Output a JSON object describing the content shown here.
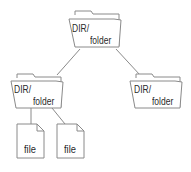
{
  "diagram": {
    "type": "directory-tree",
    "colors": {
      "stroke": "#8a8a8a",
      "fill": "#ffffff",
      "text": "#2a2a2a"
    },
    "nodes": [
      {
        "id": "root",
        "kind": "folder",
        "line1": "DIR/",
        "line2": "folder"
      },
      {
        "id": "left",
        "kind": "folder",
        "line1": "DIR/",
        "line2": "folder"
      },
      {
        "id": "right",
        "kind": "folder",
        "line1": "DIR/",
        "line2": "folder"
      },
      {
        "id": "file1",
        "kind": "file",
        "label": "file"
      },
      {
        "id": "file2",
        "kind": "file",
        "label": "file"
      }
    ],
    "edges": [
      {
        "from": "root",
        "to": "left"
      },
      {
        "from": "root",
        "to": "right"
      },
      {
        "from": "left",
        "to": "file1"
      },
      {
        "from": "left",
        "to": "file2"
      }
    ]
  }
}
